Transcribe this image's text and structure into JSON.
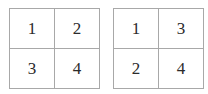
{
  "figure": {
    "background_color": "#ffffff",
    "border_color": "#a8a8a8",
    "text_color": "#2b2b2b"
  },
  "matrices": [
    {
      "name": "left-matrix",
      "rows": [
        [
          "1",
          "2"
        ],
        [
          "3",
          "4"
        ]
      ]
    },
    {
      "name": "right-matrix",
      "rows": [
        [
          "1",
          "3"
        ],
        [
          "2",
          "4"
        ]
      ]
    }
  ]
}
